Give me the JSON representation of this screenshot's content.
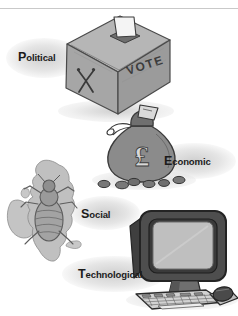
{
  "figure": {
    "style": "grayscale hand-drawn clip art",
    "background_color": "#ffffff",
    "ink_color": "#1b1b1b"
  },
  "labels": {
    "political": {
      "cap": "P",
      "rest": "olitical",
      "full": "Political"
    },
    "economic": {
      "cap": "E",
      "rest": "conomic",
      "full": "Economic"
    },
    "social": {
      "cap": "S",
      "rest": "ocial",
      "full": "Social"
    },
    "technological": {
      "cap": "T",
      "rest": "echnological",
      "full": "Technological"
    }
  },
  "illustrations": {
    "ballot_box": {
      "name": "ballot-box",
      "represents": "Political",
      "front_text": "VOTE",
      "side_mark": "X",
      "slot_item": "ballot paper",
      "colors": {
        "top": "#b4b4b4",
        "front": "#a8a8a8",
        "side": "#9a9a9a",
        "outline": "#4a4a4a"
      }
    },
    "money_bag": {
      "name": "money-bag",
      "represents": "Economic",
      "currency_symbol": "£",
      "extras": "banknote in neck, loose coins at base",
      "coin_count": 7,
      "colors": {
        "bag": "#8f8f8f",
        "shade": "#6f6f6f",
        "outline": "#3c3c3c"
      }
    },
    "uk_map": {
      "name": "uk-map-with-louse",
      "represents": "Social",
      "map_region": "United Kingdom and Ireland",
      "overlay": "louse / insect",
      "colors": {
        "map": "#c2c2c2",
        "insect": "#9a9a9a",
        "outline": "#6a6a6a"
      }
    },
    "computer": {
      "name": "desktop-computer",
      "represents": "Technological",
      "parts": [
        "CRT monitor",
        "keyboard",
        "mouse"
      ],
      "colors": {
        "case": "#4e4e4e",
        "screen": "#bdbdbd",
        "keyboard": "#d2d2d2",
        "outline": "#2a2a2a"
      }
    }
  }
}
